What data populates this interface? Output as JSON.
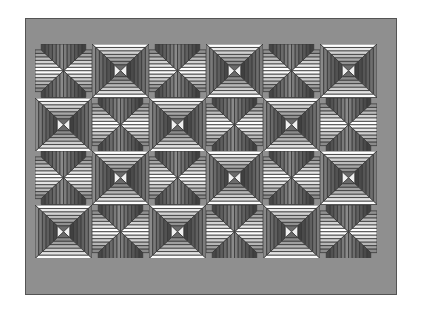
{
  "canvas": {
    "width": 428,
    "height": 315,
    "background": "#ffffff"
  },
  "artwork": {
    "title": "Pyramid Block Quilt Pattern",
    "type": "geometric-tiling",
    "frame": {
      "x": 25,
      "y": 18,
      "width": 372,
      "height": 277,
      "fill": "#8f8f8f",
      "stroke": "#545454",
      "stroke_width": 1,
      "border_thickness_left": 10,
      "border_thickness_top": 26
    },
    "grid": {
      "x": 35,
      "y": 44,
      "columns": 6,
      "rows": 4,
      "cell_width": 57,
      "cell_height": 53.5,
      "stroke": "#3a3a3a",
      "stroke_width": 0.8
    },
    "palette": {
      "background": "#ffffff",
      "frame_gray": "#8f8f8f",
      "frame_edge": "#545454",
      "dark_gray": "#6f6f6f",
      "mid_gray": "#9a9a9a",
      "light_gray": "#c9c9c9",
      "pale": "#e2e2e2",
      "near_white": "#f4f4f4",
      "white": "#ffffff",
      "outline": "#2e2e2e"
    },
    "block_rings": [
      {
        "index": 0,
        "top": "#ffffff",
        "bottom": "#fbfbfb",
        "left": "#8a8a8a",
        "right": "#7c7c7c"
      },
      {
        "index": 1,
        "top": "#e8e8e8",
        "bottom": "#e2e2e2",
        "left": "#7a7a7a",
        "right": "#6e6e6e"
      },
      {
        "index": 2,
        "top": "#d2d2d2",
        "bottom": "#cccccc",
        "left": "#6a6a6a",
        "right": "#606060"
      },
      {
        "index": 3,
        "top": "#bcbcbc",
        "bottom": "#b6b6b6",
        "left": "#5e5e5e",
        "right": "#565656"
      },
      {
        "index": 4,
        "top": "#a6a6a6",
        "bottom": "#a0a0a0",
        "left": "#525252",
        "right": "#4a4a4a"
      },
      {
        "index": 5,
        "top": "#909090",
        "bottom": "#8a8a8a",
        "left": "#474747",
        "right": "#404040"
      }
    ],
    "center": {
      "shape": "bowtie-x",
      "top_fill": "#6a6a6a",
      "bottom_fill": "#6a6a6a",
      "left_fill": "#f0f0f0",
      "right_fill": "#f0f0f0",
      "outline": "#2b2b2b"
    },
    "cells": [
      {
        "row": 0,
        "col": 0,
        "variant": "corners"
      },
      {
        "row": 0,
        "col": 1,
        "variant": "center"
      },
      {
        "row": 0,
        "col": 2,
        "variant": "corners"
      },
      {
        "row": 0,
        "col": 3,
        "variant": "center"
      },
      {
        "row": 0,
        "col": 4,
        "variant": "corners"
      },
      {
        "row": 0,
        "col": 5,
        "variant": "center"
      },
      {
        "row": 1,
        "col": 0,
        "variant": "center"
      },
      {
        "row": 1,
        "col": 1,
        "variant": "corners"
      },
      {
        "row": 1,
        "col": 2,
        "variant": "center"
      },
      {
        "row": 1,
        "col": 3,
        "variant": "corners"
      },
      {
        "row": 1,
        "col": 4,
        "variant": "center"
      },
      {
        "row": 1,
        "col": 5,
        "variant": "corners"
      },
      {
        "row": 2,
        "col": 0,
        "variant": "corners"
      },
      {
        "row": 2,
        "col": 1,
        "variant": "center"
      },
      {
        "row": 2,
        "col": 2,
        "variant": "corners"
      },
      {
        "row": 2,
        "col": 3,
        "variant": "center"
      },
      {
        "row": 2,
        "col": 4,
        "variant": "corners"
      },
      {
        "row": 2,
        "col": 5,
        "variant": "center"
      },
      {
        "row": 3,
        "col": 0,
        "variant": "center"
      },
      {
        "row": 3,
        "col": 1,
        "variant": "corners"
      },
      {
        "row": 3,
        "col": 2,
        "variant": "center"
      },
      {
        "row": 3,
        "col": 3,
        "variant": "corners"
      },
      {
        "row": 3,
        "col": 4,
        "variant": "center"
      },
      {
        "row": 3,
        "col": 5,
        "variant": "corners"
      }
    ]
  }
}
